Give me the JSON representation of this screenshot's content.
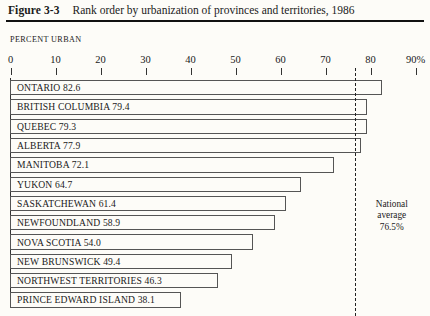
{
  "figure": {
    "number": "Figure 3-3",
    "title": "Rank order by urbanization of provinces and territories, 1986"
  },
  "axis": {
    "label": "PERCENT URBAN",
    "tick_labels": [
      "0",
      "10",
      "20",
      "30",
      "40",
      "50",
      "60",
      "70",
      "80",
      "90%"
    ],
    "tick_values": [
      0,
      10,
      20,
      30,
      40,
      50,
      60,
      70,
      80,
      90
    ],
    "min": 0,
    "max": 90
  },
  "annotation": {
    "line1": "National",
    "line2": "average",
    "line3": "76.5%",
    "value": 76.5
  },
  "chart_data": {
    "type": "bar",
    "orientation": "horizontal",
    "title": "Rank order by urbanization of provinces and territories, 1986",
    "xlabel": "PERCENT URBAN",
    "ylabel": "",
    "xlim": [
      0,
      90
    ],
    "grid": false,
    "legend": null,
    "categories": [
      "ONTARIO",
      "BRITISH COLUMBIA",
      "QUEBEC",
      "ALBERTA",
      "MANITOBA",
      "YUKON",
      "SASKATCHEWAN",
      "NEWFOUNDLAND",
      "NOVA SCOTIA",
      "NEW BRUNSWICK",
      "NORTHWEST TERRITORIES",
      "PRINCE EDWARD ISLAND"
    ],
    "values": [
      82.6,
      79.4,
      79.3,
      77.9,
      72.1,
      64.7,
      61.4,
      58.9,
      54.0,
      49.4,
      46.3,
      38.1
    ],
    "bar_labels": [
      "ONTARIO  82.6",
      "BRITISH COLUMBIA  79.4",
      "QUEBEC  79.3",
      "ALBERTA  77.9",
      "MANITOBA  72.1",
      "YUKON  64.7",
      "SASKATCHEWAN  61.4",
      "NEWFOUNDLAND  58.9",
      "NOVA SCOTIA  54.0",
      "NEW BRUNSWICK  49.4",
      "NORTHWEST TERRITORIES  46.3",
      "PRINCE EDWARD ISLAND  38.1"
    ],
    "reference_line": {
      "label": "National average",
      "value": 76.5,
      "style": "dashed"
    }
  },
  "colors": {
    "page_background": "#fdfcf8",
    "ink": "#1a1a1a",
    "rule": "#111111",
    "bar_outline": "#555555",
    "bar_fill": "#fdfcf8"
  }
}
